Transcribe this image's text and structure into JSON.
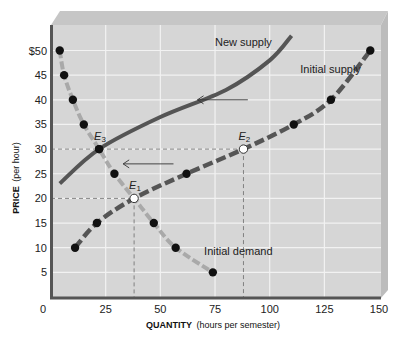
{
  "chart_data": {
    "type": "line",
    "title": "",
    "xlabel": "QUANTITY (hours per semester)",
    "xlabel_bold": "QUANTITY",
    "xlabel_rest": "(hours per semester)",
    "ylabel": "PRICE (per hour)",
    "ylabel_bold": "PRICE",
    "ylabel_rest": "(per hour)",
    "xlim": [
      0,
      150
    ],
    "ylim": [
      0,
      50
    ],
    "x_ticks": [
      "0",
      "25",
      "50",
      "75",
      "100",
      "125",
      "150"
    ],
    "x_tick_values": [
      0,
      25,
      50,
      75,
      100,
      125,
      150
    ],
    "y_ticks": [
      "5",
      "10",
      "15",
      "20",
      "25",
      "30",
      "35",
      "40",
      "45",
      "$50"
    ],
    "y_tick_values": [
      5,
      10,
      15,
      20,
      25,
      30,
      35,
      40,
      45,
      50
    ],
    "grid": true,
    "series": [
      {
        "name": "Initial demand",
        "style": "dashed-light",
        "color": "#a9a9a9",
        "points": [
          {
            "x": 4,
            "y": 50
          },
          {
            "x": 6,
            "y": 45
          },
          {
            "x": 10,
            "y": 40
          },
          {
            "x": 15,
            "y": 35
          },
          {
            "x": 22,
            "y": 30
          },
          {
            "x": 29,
            "y": 25
          },
          {
            "x": 38,
            "y": 20
          },
          {
            "x": 47,
            "y": 15
          },
          {
            "x": 57,
            "y": 10
          },
          {
            "x": 74,
            "y": 5
          }
        ]
      },
      {
        "name": "Initial supply",
        "style": "dashed-dark",
        "color": "#555555",
        "points": [
          {
            "x": 11,
            "y": 10
          },
          {
            "x": 21,
            "y": 15
          },
          {
            "x": 38,
            "y": 20
          },
          {
            "x": 62,
            "y": 25
          },
          {
            "x": 88,
            "y": 30
          },
          {
            "x": 111,
            "y": 35
          },
          {
            "x": 128,
            "y": 40
          },
          {
            "x": 146,
            "y": 50
          }
        ]
      },
      {
        "name": "New supply",
        "style": "solid-dark",
        "color": "#555555",
        "points": [
          {
            "x": 4,
            "y": 23
          },
          {
            "x": 22,
            "y": 30
          },
          {
            "x": 50,
            "y": 36.5
          },
          {
            "x": 80,
            "y": 42
          },
          {
            "x": 100,
            "y": 48
          },
          {
            "x": 110,
            "y": 53
          }
        ]
      }
    ],
    "equilibria": [
      {
        "label": "E",
        "sub": "1",
        "x": 38,
        "y": 20,
        "marker": "open"
      },
      {
        "label": "E",
        "sub": "2",
        "x": 88,
        "y": 30,
        "marker": "open"
      },
      {
        "label": "E",
        "sub": "3",
        "x": 22,
        "y": 30,
        "marker": "filled"
      }
    ],
    "reference_lines": [
      {
        "type": "horizontal",
        "y": 30,
        "x_to": 88
      },
      {
        "type": "horizontal",
        "y": 20,
        "x_to": 38
      },
      {
        "type": "vertical",
        "x": 38,
        "y_to": 20
      },
      {
        "type": "vertical",
        "x": 88,
        "y_to": 30
      }
    ],
    "annotations": [
      {
        "text": "New supply",
        "x": 75,
        "y": 51
      },
      {
        "text": "Initial supply",
        "x": 114,
        "y": 45.5
      },
      {
        "text": "Initial demand",
        "x": 70,
        "y": 8.5
      },
      {
        "text": "arrow-left",
        "x_from": 90,
        "x_to": 67,
        "y": 40
      },
      {
        "text": "arrow-left",
        "x_from": 56,
        "x_to": 33,
        "y": 27
      }
    ]
  },
  "colors": {
    "plot_background": "#d6d6d6",
    "grid": "#f2f2f2",
    "bevel_top": "#c4c4c4",
    "bevel_side": "#bdbdbd",
    "axis": "#555555",
    "demand": "#a9a9a9",
    "supply": "#555555",
    "marker": "#111111"
  }
}
